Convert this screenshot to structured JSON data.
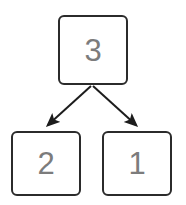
{
  "diagram": {
    "type": "tree",
    "background_color": "#ffffff",
    "node_border_color": "#2b2b2b",
    "node_fill_color": "#ffffff",
    "label_color": "#7c7c7c",
    "edge_color": "#1c1c1c",
    "nodes": [
      {
        "id": "root",
        "label": "3",
        "role": "parent-node",
        "position": "top-center"
      },
      {
        "id": "left",
        "label": "2",
        "role": "child-node",
        "position": "bottom-left"
      },
      {
        "id": "right",
        "label": "1",
        "role": "child-node",
        "position": "bottom-right"
      }
    ],
    "edges": [
      {
        "id": "root-to-left",
        "from": "root",
        "to": "left",
        "arrowhead": "filled-triangle"
      },
      {
        "id": "root-to-right",
        "from": "root",
        "to": "right",
        "arrowhead": "filled-triangle"
      }
    ]
  }
}
